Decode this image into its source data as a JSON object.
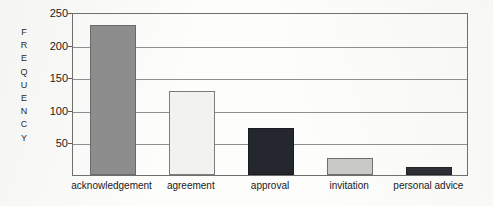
{
  "chart_data": {
    "type": "bar",
    "title": "",
    "xlabel": "",
    "ylabel": "FREQUENCY",
    "ylabel_letters": [
      "F",
      "R",
      "E",
      "Q",
      "U",
      "E",
      "N",
      "C",
      "Y"
    ],
    "categories": [
      "acknowledgement",
      "agreement",
      "approval",
      "invitation",
      "personal advice"
    ],
    "values": [
      230,
      129,
      72,
      26,
      12
    ],
    "ylim": [
      0,
      250
    ],
    "yticks": [
      50,
      100,
      150,
      200,
      250
    ],
    "ytick_labels": [
      "50",
      "100",
      "150",
      "200",
      "250"
    ],
    "grid": true,
    "legend": false,
    "bar_colors": [
      "#8d8d8d",
      "#f2f2f0",
      "#24272e",
      "#c9c9c7",
      "#2c2f35"
    ],
    "axis_color": "#6f6f6f",
    "grid_color": "#8e8e8e",
    "background": "#fdfdfb"
  }
}
